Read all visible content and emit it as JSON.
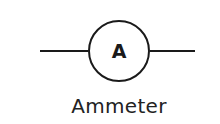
{
  "diagram": {
    "type": "circuit-symbol",
    "symbol_letter": "A",
    "caption": "Ammeter",
    "colors": {
      "stroke": "#1a1a1a",
      "background": "#ffffff",
      "text": "#222222"
    }
  }
}
